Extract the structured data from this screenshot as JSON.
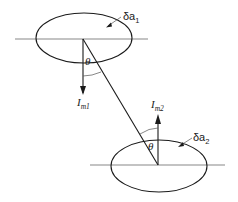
{
  "diagram": {
    "elements": [
      {
        "name": "surface-1",
        "area_label": {
          "main": "δa",
          "sub": "1"
        },
        "normal_label": {
          "main": "I",
          "sub": "m1"
        },
        "normal_direction": "down",
        "angle_label": "θ"
      },
      {
        "name": "surface-2",
        "area_label": {
          "main": "δa",
          "sub": "2"
        },
        "normal_label": {
          "main": "I",
          "sub": "m2"
        },
        "normal_direction": "up",
        "angle_label": "θ"
      }
    ],
    "connector": "line joining the centres of the two surfaces"
  }
}
